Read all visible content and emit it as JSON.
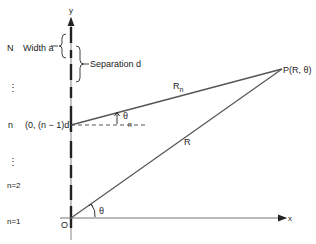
{
  "diagram": {
    "axes": {
      "y_label": "y",
      "x_label": "x",
      "origin_label": "O"
    },
    "left_labels": {
      "N": "N",
      "dots_top": "⋮",
      "n": "n",
      "dots_mid": "⋮",
      "n2": "n=2",
      "n1": "n=1"
    },
    "annotations": {
      "width": "Width a",
      "separation": "Separation d",
      "source_coord": "(0, (n − 1)d)",
      "point": "P(R, θ)",
      "Rn": "R",
      "Rn_sub": "n",
      "R": "R",
      "theta_n": "θ",
      "theta_n_sub": "n",
      "theta": "θ"
    },
    "colors": {
      "line": "#333333",
      "slit": "#222222",
      "gap": "#9a9a9a"
    }
  }
}
